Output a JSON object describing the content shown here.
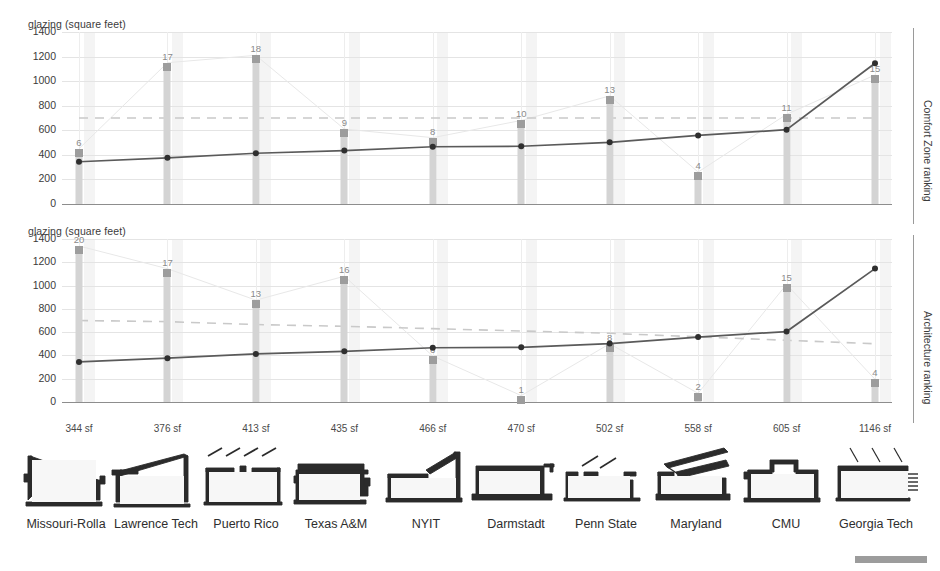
{
  "chart_data": [
    {
      "type": "bar",
      "title": "Comfort Zone ranking",
      "ylabel": "glazing (square feet)",
      "xlabel": "",
      "ylim": [
        0,
        1400
      ],
      "yticks": [
        0,
        200,
        400,
        600,
        800,
        1000,
        1200,
        1400
      ],
      "grid": true,
      "legend": "none",
      "right_axis_label": "Comfort Zone ranking",
      "categories": [
        "344 sf",
        "376 sf",
        "413 sf",
        "435 sf",
        "466 sf",
        "470 sf",
        "502 sf",
        "558 sf",
        "605 sf",
        "1146 sf"
      ],
      "series": [
        {
          "name": "Comfort Zone ranking (bar height in glazing units)",
          "values": [
            450,
            1150,
            1210,
            610,
            540,
            680,
            880,
            260,
            730,
            1050
          ],
          "labels": [
            6,
            17,
            18,
            9,
            8,
            10,
            13,
            4,
            11,
            15
          ]
        },
        {
          "name": "glazing (square feet)",
          "values": [
            344,
            376,
            413,
            435,
            466,
            470,
            502,
            558,
            605,
            1146
          ]
        }
      ],
      "reference_line": {
        "name": "dashed reference",
        "values": [
          700,
          700,
          700,
          700,
          700,
          700,
          700,
          700,
          700,
          700
        ],
        "style": "dashed"
      }
    },
    {
      "type": "bar",
      "title": "Architecture ranking",
      "ylabel": "glazing (square feet)",
      "xlabel": "",
      "ylim": [
        0,
        1400
      ],
      "yticks": [
        0,
        200,
        400,
        600,
        800,
        1000,
        1200,
        1400
      ],
      "grid": true,
      "legend": "none",
      "right_axis_label": "Architecture ranking",
      "categories": [
        "344 sf",
        "376 sf",
        "413 sf",
        "435 sf",
        "466 sf",
        "470 sf",
        "502 sf",
        "558 sf",
        "605 sf",
        "1146 sf"
      ],
      "series": [
        {
          "name": "Architecture ranking (bar height in glazing units)",
          "values": [
            1340,
            1145,
            875,
            1080,
            395,
            55,
            500,
            75,
            1010,
            195
          ],
          "labels": [
            20,
            17,
            13,
            16,
            6,
            1,
            8,
            2,
            15,
            4
          ]
        },
        {
          "name": "glazing (square feet)",
          "values": [
            344,
            376,
            413,
            435,
            466,
            470,
            502,
            558,
            605,
            1146
          ]
        }
      ],
      "reference_line": {
        "name": "dashed reference",
        "values": [
          700,
          690,
          665,
          650,
          630,
          610,
          590,
          560,
          530,
          500
        ],
        "style": "dashed"
      }
    }
  ],
  "charts": [
    {
      "ylabel": "glazing (square feet)",
      "right_axis_label": "Comfort Zone ranking",
      "yticks": [
        "1400",
        "1200",
        "1000",
        "800",
        "600",
        "400",
        "200",
        "0"
      ]
    },
    {
      "ylabel": "glazing (square feet)",
      "right_axis_label": "Architecture ranking",
      "yticks": [
        "1400",
        "1200",
        "1000",
        "800",
        "600",
        "400",
        "200",
        "0"
      ]
    }
  ],
  "xticks": [
    "344 sf",
    "376 sf",
    "413 sf",
    "435 sf",
    "466 sf",
    "470 sf",
    "502 sf",
    "558 sf",
    "605 sf",
    "1146 sf"
  ],
  "sections": [
    {
      "name": "Missouri-Rolla",
      "icon": "building-section-icon"
    },
    {
      "name": "Lawrence Tech",
      "icon": "building-section-icon"
    },
    {
      "name": "Puerto Rico",
      "icon": "building-section-icon"
    },
    {
      "name": "Texas A&M",
      "icon": "building-section-icon"
    },
    {
      "name": "NYIT",
      "icon": "building-section-icon"
    },
    {
      "name": "Darmstadt",
      "icon": "building-section-icon"
    },
    {
      "name": "Penn State",
      "icon": "building-section-icon"
    },
    {
      "name": "Maryland",
      "icon": "building-section-icon"
    },
    {
      "name": "CMU",
      "icon": "building-section-icon"
    },
    {
      "name": "Georgia Tech",
      "icon": "building-section-icon"
    }
  ],
  "colors": {
    "line": "#5a5a5a",
    "bar": "#d4d4d4",
    "bar_cap": "#9d9d9d",
    "grid": "#e4e4e4",
    "axis": "#8d8d8d",
    "text": "#3b3b3b",
    "ghost": "#f1f1f1",
    "scalebar": "#9c9c9c"
  },
  "scalebar": {
    "name": "scale-bar"
  }
}
